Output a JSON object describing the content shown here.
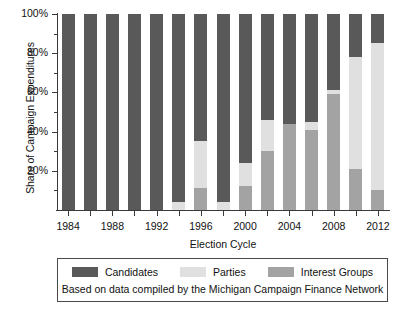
{
  "chart_data": {
    "type": "bar",
    "subtype": "stacked-percent",
    "title": "",
    "xlabel": "Election Cycle",
    "ylabel": "Share of Campaign Expenditures",
    "ylim": [
      0,
      100
    ],
    "ytick_labels": [
      "20%",
      "40%",
      "60%",
      "80%",
      "100%"
    ],
    "ytick_values": [
      20,
      40,
      60,
      80,
      100
    ],
    "yminor_values": [
      10,
      30,
      50,
      70,
      90
    ],
    "grid": false,
    "legend_position": "below-plot",
    "categories": [
      "1984",
      "1986",
      "1988",
      "1990",
      "1992",
      "1994",
      "1996",
      "1998",
      "2000",
      "2002",
      "2004",
      "2006",
      "2008",
      "2010",
      "2012"
    ],
    "xtick_labels": [
      "1984",
      "1988",
      "1992",
      "1996",
      "2000",
      "2004",
      "2008",
      "2012"
    ],
    "series": [
      {
        "name": "Candidates",
        "color": "#595959",
        "values": [
          100,
          100,
          100,
          100,
          100,
          96,
          65,
          96,
          76,
          54,
          56,
          55,
          39,
          22,
          15
        ]
      },
      {
        "name": "Parties",
        "color": "#e0e0e0",
        "values": [
          0,
          0,
          0,
          0,
          0,
          4,
          24,
          4,
          12,
          16,
          0,
          4,
          2,
          57,
          75
        ]
      },
      {
        "name": "Interest Groups",
        "color": "#a3a3a3",
        "values": [
          0,
          0,
          0,
          0,
          0,
          0,
          11,
          0,
          12,
          30,
          44,
          41,
          59,
          21,
          10
        ]
      }
    ],
    "annotation": "Based on data compiled by the Michigan Campaign Finance Network"
  },
  "legend": {
    "items": [
      {
        "label": "Candidates",
        "color": "#595959"
      },
      {
        "label": "Parties",
        "color": "#e0e0e0"
      },
      {
        "label": "Interest Groups",
        "color": "#a3a3a3"
      }
    ],
    "caption": "Based on data compiled by the Michigan Campaign Finance Network"
  },
  "axes": {
    "x_title": "Election Cycle",
    "y_title": "Share of Campaign Expenditures"
  }
}
